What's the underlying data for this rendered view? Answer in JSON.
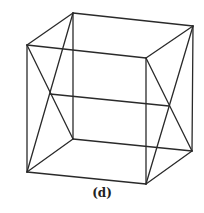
{
  "figure": {
    "caption": "(d)",
    "stroke_color": "#2a2a2a",
    "vertices": {
      "back_top_left": [
        73,
        13
      ],
      "back_top_right": [
        193,
        26
      ],
      "front_top_left": [
        27,
        45
      ],
      "front_top_right": [
        146,
        58
      ],
      "back_bottom_left": [
        73,
        139
      ],
      "back_bottom_right": [
        192,
        151
      ],
      "front_bottom_left": [
        27,
        172
      ],
      "front_bottom_right": [
        146,
        184
      ]
    }
  }
}
